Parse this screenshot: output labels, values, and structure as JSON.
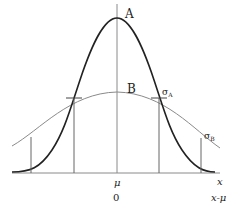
{
  "curves": [
    {
      "name": "A",
      "label": "A",
      "sigma_label": "σ",
      "sigma_sub": "A",
      "description": "narrow, tall normal curve",
      "color": "#222222"
    },
    {
      "name": "B",
      "label": "B",
      "sigma_label": "σ",
      "sigma_sub": "B",
      "description": "wide, flat normal curve",
      "color": "#8a8a8a"
    }
  ],
  "axis": {
    "mean_label": "μ",
    "x_label": "x",
    "zero_label": "0",
    "centered_label": "x-μ"
  },
  "colors": {
    "curve_a": "#222222",
    "curve_b": "#8a8a8a",
    "axis": "#8a8a8a",
    "guide": "#666666"
  }
}
